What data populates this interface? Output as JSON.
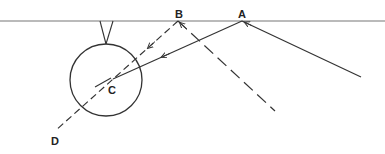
{
  "diagram": {
    "colors": {
      "line": "#333333",
      "surface": "#777777",
      "background": "#ffffff"
    },
    "labels": {
      "A": "A",
      "B": "B",
      "C": "C",
      "D": "D"
    },
    "elements": {
      "surface_line": "horizontal reference surface",
      "suspension": "V-shaped suspension holding sphere",
      "sphere": "circle (sphere)",
      "incident_ray": "solid ray toward A",
      "reflected_ray": "solid ray A to C",
      "dashed_ray_BD": "dashed line from B through C to D",
      "dashed_ray_B_right": "dashed line from B to lower right"
    }
  }
}
